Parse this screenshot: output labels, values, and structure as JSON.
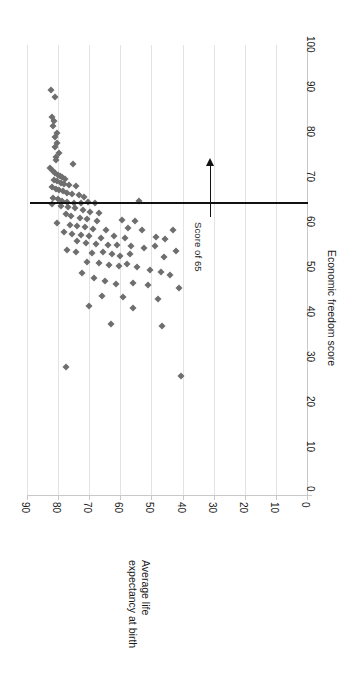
{
  "chart_data": {
    "type": "scatter",
    "title": "",
    "orientation": "rotated-90-clockwise",
    "xlabel": "Average life expectancy at birth",
    "xlabel_lines": [
      "Average life",
      "expectancy at birth"
    ],
    "ylabel": "Economic freedom score",
    "xlim": [
      0,
      90
    ],
    "ylim": [
      0,
      100
    ],
    "xticks": [
      90,
      80,
      70,
      60,
      50,
      40,
      30,
      20,
      10,
      0
    ],
    "yticks": [
      0,
      10,
      20,
      30,
      40,
      50,
      60,
      70,
      80,
      90,
      100
    ],
    "grid": "vertical-gridlines-on-life-expectancy-axis",
    "legend": "none",
    "marker": {
      "shape": "diamond",
      "color": "#6e6e6e",
      "size": 5
    },
    "annotations": [
      {
        "name": "score-of-65-reference-line",
        "text": "Score of 65",
        "value": 65,
        "axis": "Economic freedom score",
        "arrow": "up"
      }
    ],
    "reference_line": {
      "axis": "y",
      "value": 65,
      "color": "#111111"
    },
    "points": [
      {
        "life": 82.3,
        "score": 90.0
      },
      {
        "life": 81.0,
        "score": 88.5
      },
      {
        "life": 82.1,
        "score": 84.0
      },
      {
        "life": 81.4,
        "score": 83.2
      },
      {
        "life": 81.6,
        "score": 82.1
      },
      {
        "life": 80.3,
        "score": 80.5
      },
      {
        "life": 81.1,
        "score": 79.6
      },
      {
        "life": 80.2,
        "score": 78.2
      },
      {
        "life": 81.0,
        "score": 77.4
      },
      {
        "life": 79.8,
        "score": 76.1
      },
      {
        "life": 80.6,
        "score": 75.2
      },
      {
        "life": 80.8,
        "score": 74.4
      },
      {
        "life": 75.1,
        "score": 73.6
      },
      {
        "life": 82.5,
        "score": 72.6
      },
      {
        "life": 81.8,
        "score": 72.0
      },
      {
        "life": 80.9,
        "score": 71.6
      },
      {
        "life": 80.1,
        "score": 71.2
      },
      {
        "life": 79.4,
        "score": 70.9
      },
      {
        "life": 78.6,
        "score": 70.6
      },
      {
        "life": 77.8,
        "score": 70.3
      },
      {
        "life": 81.3,
        "score": 70.0
      },
      {
        "life": 80.4,
        "score": 69.7
      },
      {
        "life": 79.0,
        "score": 69.4
      },
      {
        "life": 78.0,
        "score": 69.1
      },
      {
        "life": 76.5,
        "score": 68.9
      },
      {
        "life": 74.2,
        "score": 68.6
      },
      {
        "life": 81.9,
        "score": 68.4
      },
      {
        "life": 80.7,
        "score": 68.1
      },
      {
        "life": 79.6,
        "score": 67.8
      },
      {
        "life": 78.4,
        "score": 67.5
      },
      {
        "life": 77.2,
        "score": 67.2
      },
      {
        "life": 75.6,
        "score": 66.9
      },
      {
        "life": 73.4,
        "score": 66.6
      },
      {
        "life": 71.8,
        "score": 66.3
      },
      {
        "life": 81.5,
        "score": 66.0
      },
      {
        "life": 80.0,
        "score": 65.7
      },
      {
        "life": 78.8,
        "score": 65.4
      },
      {
        "life": 77.0,
        "score": 65.2
      },
      {
        "life": 75.0,
        "score": 65.0
      },
      {
        "life": 72.6,
        "score": 65.0
      },
      {
        "life": 70.4,
        "score": 65.1
      },
      {
        "life": 68.0,
        "score": 65.0
      },
      {
        "life": 54.0,
        "score": 65.3
      },
      {
        "life": 82.0,
        "score": 64.6
      },
      {
        "life": 79.2,
        "score": 64.3
      },
      {
        "life": 76.8,
        "score": 64.0
      },
      {
        "life": 74.6,
        "score": 63.7
      },
      {
        "life": 72.0,
        "score": 63.4
      },
      {
        "life": 69.6,
        "score": 63.0
      },
      {
        "life": 66.8,
        "score": 62.7
      },
      {
        "life": 77.6,
        "score": 62.4
      },
      {
        "life": 75.8,
        "score": 62.0
      },
      {
        "life": 73.0,
        "score": 61.6
      },
      {
        "life": 70.8,
        "score": 61.3
      },
      {
        "life": 67.5,
        "score": 61.0
      },
      {
        "life": 59.5,
        "score": 61.2
      },
      {
        "life": 55.2,
        "score": 61.0
      },
      {
        "life": 80.5,
        "score": 60.4
      },
      {
        "life": 76.2,
        "score": 60.1
      },
      {
        "life": 74.0,
        "score": 59.8
      },
      {
        "life": 71.4,
        "score": 59.5
      },
      {
        "life": 68.8,
        "score": 59.2
      },
      {
        "life": 64.6,
        "score": 59.0
      },
      {
        "life": 57.5,
        "score": 59.4
      },
      {
        "life": 53.0,
        "score": 59.0
      },
      {
        "life": 78.2,
        "score": 58.4
      },
      {
        "life": 75.4,
        "score": 58.1
      },
      {
        "life": 72.8,
        "score": 57.8
      },
      {
        "life": 70.0,
        "score": 57.5
      },
      {
        "life": 66.2,
        "score": 57.2
      },
      {
        "life": 62.0,
        "score": 57.6
      },
      {
        "life": 58.4,
        "score": 57.2
      },
      {
        "life": 48.5,
        "score": 57.4
      },
      {
        "life": 45.5,
        "score": 57.0
      },
      {
        "life": 43.0,
        "score": 58.8
      },
      {
        "life": 73.8,
        "score": 56.4
      },
      {
        "life": 71.0,
        "score": 56.1
      },
      {
        "life": 67.8,
        "score": 55.8
      },
      {
        "life": 64.0,
        "score": 55.5
      },
      {
        "life": 61.0,
        "score": 55.6
      },
      {
        "life": 56.5,
        "score": 55.3
      },
      {
        "life": 52.5,
        "score": 55.0
      },
      {
        "life": 49.0,
        "score": 55.4
      },
      {
        "life": 77.2,
        "score": 54.4
      },
      {
        "life": 74.4,
        "score": 54.1
      },
      {
        "life": 69.0,
        "score": 53.8
      },
      {
        "life": 65.5,
        "score": 54.0
      },
      {
        "life": 62.8,
        "score": 53.5
      },
      {
        "life": 60.0,
        "score": 53.2
      },
      {
        "life": 57.0,
        "score": 53.6
      },
      {
        "life": 46.0,
        "score": 53.0
      },
      {
        "life": 42.0,
        "score": 54.2
      },
      {
        "life": 70.6,
        "score": 51.8
      },
      {
        "life": 67.0,
        "score": 51.5
      },
      {
        "life": 63.5,
        "score": 51.2
      },
      {
        "life": 60.5,
        "score": 51.0
      },
      {
        "life": 58.0,
        "score": 51.4
      },
      {
        "life": 54.5,
        "score": 50.6
      },
      {
        "life": 50.5,
        "score": 50.0
      },
      {
        "life": 47.0,
        "score": 49.6
      },
      {
        "life": 44.0,
        "score": 49.0
      },
      {
        "life": 72.2,
        "score": 49.4
      },
      {
        "life": 68.4,
        "score": 48.2
      },
      {
        "life": 64.8,
        "score": 47.6
      },
      {
        "life": 61.5,
        "score": 47.0
      },
      {
        "life": 56.0,
        "score": 47.2
      },
      {
        "life": 51.0,
        "score": 46.6
      },
      {
        "life": 41.0,
        "score": 46.0
      },
      {
        "life": 66.0,
        "score": 44.2
      },
      {
        "life": 59.0,
        "score": 44.0
      },
      {
        "life": 48.0,
        "score": 43.6
      },
      {
        "life": 70.2,
        "score": 42.0
      },
      {
        "life": 55.8,
        "score": 41.5
      },
      {
        "life": 63.0,
        "score": 38.0
      },
      {
        "life": 46.5,
        "score": 37.5
      },
      {
        "life": 77.5,
        "score": 28.5
      },
      {
        "life": 40.5,
        "score": 26.5
      }
    ]
  },
  "axes": {
    "life_ticks": [
      "90",
      "80",
      "70",
      "60",
      "50",
      "40",
      "30",
      "20",
      "10",
      "0"
    ],
    "score_ticks": [
      "0",
      "10",
      "20",
      "30",
      "40",
      "50",
      "60",
      "70",
      "80",
      "90",
      "100"
    ],
    "life_title_line1": "Average life",
    "life_title_line2": "expectancy at birth",
    "score_title": "Economic freedom score"
  },
  "annotation": {
    "label": "Score of 65"
  },
  "colors": {
    "marker": "#6e6e6e",
    "gridline": "#e3e3e3",
    "axis": "#c9c9c9",
    "reference_line": "#111111",
    "text": "#1a1a1a",
    "background": "#ffffff"
  }
}
